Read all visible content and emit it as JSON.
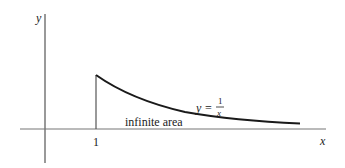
{
  "diagram": {
    "axes": {
      "x_label": "x",
      "y_label": "y",
      "x_tick_label": "1"
    },
    "curve": {
      "equation_lhs": "y =",
      "equation_numerator": "1",
      "equation_denominator": "x"
    },
    "region_label": "infinite area",
    "colors": {
      "axis": "#555555",
      "curve": "#1a1a1a",
      "text": "#222222"
    }
  }
}
